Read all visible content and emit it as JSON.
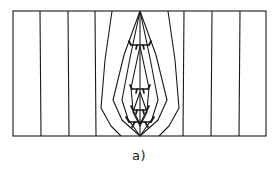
{
  "figure": {
    "caption": "a)",
    "type": "technical-line-diagram",
    "colors": {
      "stroke": "#1a1a1a",
      "background": "#ffffff",
      "caption": "#1a1a1a"
    },
    "frame": {
      "x": 13,
      "y": 11,
      "width": 253,
      "height": 125,
      "stroke_width": 1.1
    },
    "vertical_lines": [
      {
        "name": "line-1",
        "top_x": 40,
        "bottom_x": 41
      },
      {
        "name": "line-2",
        "top_x": 68,
        "bottom_x": 69
      },
      {
        "name": "line-3",
        "top_x": 95,
        "bottom_x": 96
      },
      {
        "name": "line-8",
        "top_x": 184,
        "bottom_x": 183
      },
      {
        "name": "line-9",
        "top_x": 212,
        "bottom_x": 211
      },
      {
        "name": "line-10",
        "top_x": 240,
        "bottom_x": 239
      }
    ],
    "deflected_lines": [
      {
        "name": "deflected-left-outer",
        "points": "112,11 105,60 101,108 111,126 121,136"
      },
      {
        "name": "deflected-right-outer",
        "points": "168,11 175,60 179,108 169,126 159,136"
      }
    ],
    "lens_contours": [
      {
        "name": "lens-contour-outer",
        "points": "140,11 124,55 113,100 122,120 140,136 158,120 167,100 156,55 140,11"
      },
      {
        "name": "lens-contour-middle",
        "points": "140,11 130,58 122,100 128,119 140,136 152,119 158,100 150,58 140,11"
      },
      {
        "name": "lens-contour-inner",
        "points": "140,46 131,88 133,110 140,124 147,110 149,88 140,46"
      },
      {
        "name": "lens-contour-innermost",
        "points": "140,92 133,112 140,126 147,112 140,92"
      }
    ],
    "axis_line": {
      "name": "lens-axis",
      "x": 140,
      "y1": 11,
      "y2": 136
    },
    "bracket_markings": [
      {
        "name": "bracket-1",
        "cx": 140,
        "cy": 45,
        "w": 19,
        "h": 7
      },
      {
        "name": "bracket-2",
        "cx": 140,
        "cy": 89,
        "w": 17,
        "h": 6
      },
      {
        "name": "bracket-3",
        "cx": 140,
        "cy": 110,
        "w": 15,
        "h": 6
      },
      {
        "name": "bracket-4",
        "cx": 140,
        "cy": 123,
        "w": 22,
        "h": 8
      }
    ]
  }
}
